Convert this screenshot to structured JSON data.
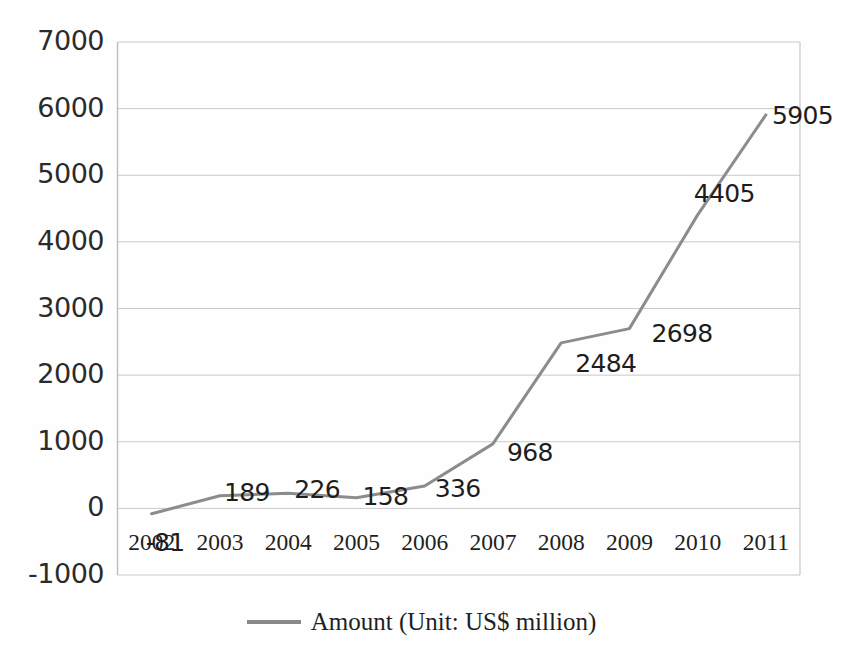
{
  "chart_data": {
    "type": "line",
    "title": "",
    "subtitle": "",
    "xlabel": "",
    "ylabel": "",
    "categories": [
      "2002",
      "2003",
      "2004",
      "2005",
      "2006",
      "2007",
      "2008",
      "2009",
      "2010",
      "2011"
    ],
    "series": [
      {
        "name": "Amount (Unit: US$ million)",
        "color": "#8c8c8c",
        "values": [
          -81,
          189,
          226,
          158,
          336,
          968,
          2484,
          2698,
          4405,
          5905
        ]
      }
    ],
    "point_labels": [
      "-81",
      "189",
      "226",
      "158",
      "336",
      "968",
      "2484",
      "2698",
      "4405",
      "5905"
    ],
    "ylim": [
      -1000,
      7000
    ],
    "ytick_values": [
      7000,
      6000,
      5000,
      4000,
      3000,
      2000,
      1000,
      0,
      -1000
    ],
    "ytick_labels": [
      "7000",
      "6000",
      "5000",
      "4000",
      "3000",
      "2000",
      "1000",
      "0",
      "-1000"
    ],
    "grid": true,
    "grid_axis": "y",
    "legend_position": "bottom",
    "legend_entries": [
      "Amount (Unit: US$ million)"
    ],
    "marker": "none",
    "line_width": 3
  },
  "legend": {
    "marker_name": "legend-line-marker",
    "label": "Amount (Unit: US$ million)"
  },
  "colors": {
    "series_line": "#8c8c8c",
    "gridline": "#c9c9c9",
    "plot_border": "#bdbdbd",
    "text": "#231f20",
    "background": "#ffffff"
  }
}
